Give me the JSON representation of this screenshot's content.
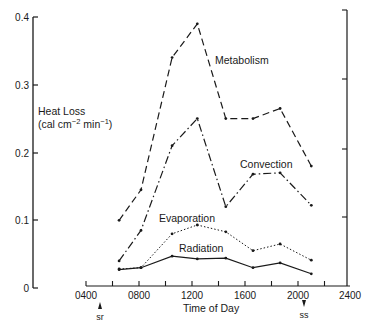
{
  "chart_data": {
    "type": "line",
    "title": "",
    "xlabel": "Time of Day",
    "ylabel": "Heat Loss (cal cm⁻² min⁻¹)",
    "ylabel_line1": "Heat Loss",
    "ylabel_line2": "(cal cm",
    "ylabel_exp1": "−2",
    "ylabel_mid": " min",
    "ylabel_exp2": "−1",
    "ylabel_end": ")",
    "xlim": [
      400,
      2400
    ],
    "ylim": [
      0,
      0.4
    ],
    "grid": false,
    "legend": "inline labels",
    "x_ticks": [
      "0400",
      "0800",
      "1200",
      "1600",
      "2000",
      "2400"
    ],
    "y_ticks": [
      "0",
      "0.1",
      "0.2",
      "0.3",
      "0.4"
    ],
    "annotations": [
      {
        "text": "sr",
        "meaning": "sunrise",
        "x": 600
      },
      {
        "text": "ss",
        "meaning": "sunset",
        "x": 2050
      }
    ],
    "x": [
      650,
      815,
      1050,
      1240,
      1455,
      1660,
      1865,
      2100
    ],
    "series": [
      {
        "name": "Metabolism",
        "style": "dashed",
        "values": [
          0.1,
          0.145,
          0.34,
          0.39,
          0.25,
          0.25,
          0.265,
          0.18
        ]
      },
      {
        "name": "Convection",
        "style": "dash-dot",
        "values": [
          0.04,
          0.085,
          0.21,
          0.25,
          0.12,
          0.168,
          0.17,
          0.122
        ]
      },
      {
        "name": "Evaporation",
        "style": "dotted",
        "values": [
          0.028,
          0.03,
          0.08,
          0.093,
          0.083,
          0.055,
          0.065,
          0.041
        ]
      },
      {
        "name": "Radiation",
        "style": "solid",
        "values": [
          0.027,
          0.03,
          0.047,
          0.043,
          0.044,
          0.03,
          0.037,
          0.021
        ]
      }
    ]
  }
}
